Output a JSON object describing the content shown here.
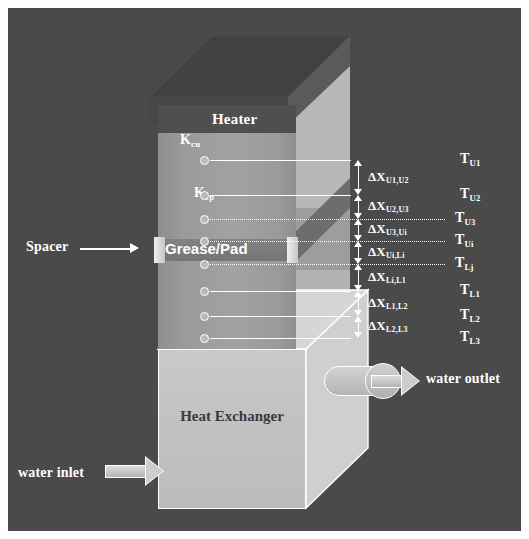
{
  "figure": {
    "title_internal": "thermal-resistance-measurement-stack",
    "background_color": "#4a4a4a",
    "frame_color": "#ffffff",
    "line_color": "#ffffff"
  },
  "components": {
    "heater_label": "Heater",
    "k_cu_label": "K",
    "k_cu_sub": "cu",
    "k_cp_label": "K",
    "k_cp_sub": "cp",
    "spacer_label": "Spacer",
    "grease_pad_label": "Grease/Pad",
    "heat_exchanger_label": "Heat Exchanger",
    "water_inlet_label": "water inlet",
    "water_outlet_label": "water outlet"
  },
  "temperatures": [
    {
      "id": "TU1",
      "symbol": "T",
      "sub": "U1",
      "y": 152,
      "line_style": "solid"
    },
    {
      "id": "TU2",
      "symbol": "T",
      "sub": "U2",
      "y": 187,
      "line_style": "solid"
    },
    {
      "id": "TU3",
      "symbol": "T",
      "sub": "U3",
      "y": 211,
      "line_style": "dotted"
    },
    {
      "id": "TUi",
      "symbol": "T",
      "sub": "Ui",
      "y": 233,
      "line_style": "dotted"
    },
    {
      "id": "TLj",
      "symbol": "T",
      "sub": "Lj",
      "y": 256,
      "line_style": "dotted"
    },
    {
      "id": "TL1",
      "symbol": "T",
      "sub": "L1",
      "y": 283,
      "line_style": "solid"
    },
    {
      "id": "TL2",
      "symbol": "T",
      "sub": "L2",
      "y": 308,
      "line_style": "solid"
    },
    {
      "id": "TL3",
      "symbol": "T",
      "sub": "L3",
      "y": 330,
      "line_style": "solid"
    }
  ],
  "distances": [
    {
      "id": "dXU1U2",
      "symbol": "ΔX",
      "sub": "U1,U2",
      "from": "TU1",
      "to": "TU2"
    },
    {
      "id": "dXU2U3",
      "symbol": "ΔX",
      "sub": "U2,U3",
      "from": "TU2",
      "to": "TU3"
    },
    {
      "id": "dXU3Ui",
      "symbol": "ΔX",
      "sub": "U3,Ui",
      "from": "TU3",
      "to": "TUi"
    },
    {
      "id": "dXUiLi",
      "symbol": "ΔX",
      "sub": "Ui,Li",
      "from": "TUi",
      "to": "TLj"
    },
    {
      "id": "dXLiL1",
      "symbol": "ΔX",
      "sub": "Li,L1",
      "from": "TLj",
      "to": "TL1"
    },
    {
      "id": "dXL1L2",
      "symbol": "ΔX",
      "sub": "L1,L2",
      "from": "TL1",
      "to": "TL2"
    },
    {
      "id": "dXL2L3",
      "symbol": "ΔX",
      "sub": "L2,L3",
      "from": "TL2",
      "to": "TL3"
    }
  ],
  "thermocouples": {
    "count": 8
  }
}
